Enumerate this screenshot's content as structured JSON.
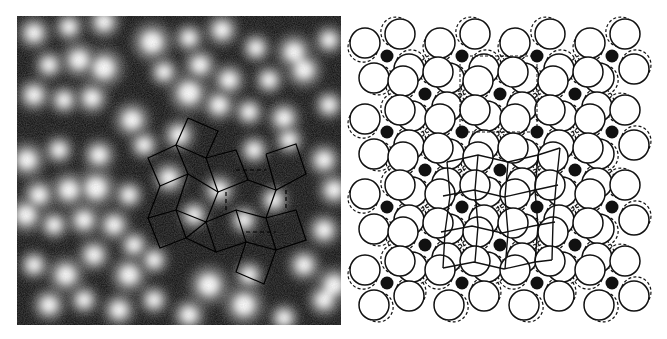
{
  "figure": {
    "caption": "Atomic-resolution image (left) and corresponding atomic structure model (right)",
    "left_panel": {
      "label": "microscopy-image",
      "bounds": {
        "x": 17,
        "y": 16,
        "w": 324,
        "h": 309
      },
      "background": "#0c0c0c",
      "spot_color": "#ffffff",
      "bright_spots": [
        [
          30,
          33,
          9
        ],
        [
          65,
          27,
          8
        ],
        [
          100,
          22,
          9
        ],
        [
          148,
          42,
          11
        ],
        [
          185,
          38,
          8
        ],
        [
          218,
          30,
          9
        ],
        [
          252,
          48,
          8
        ],
        [
          290,
          52,
          10
        ],
        [
          325,
          40,
          8
        ],
        [
          45,
          65,
          8
        ],
        [
          75,
          60,
          10
        ],
        [
          100,
          68,
          11
        ],
        [
          160,
          72,
          8
        ],
        [
          196,
          65,
          9
        ],
        [
          225,
          80,
          9
        ],
        [
          265,
          80,
          8
        ],
        [
          300,
          70,
          10
        ],
        [
          30,
          95,
          9
        ],
        [
          60,
          100,
          8
        ],
        [
          88,
          98,
          9
        ],
        [
          128,
          120,
          10
        ],
        [
          185,
          93,
          11
        ],
        [
          215,
          105,
          9
        ],
        [
          245,
          112,
          8
        ],
        [
          280,
          118,
          9
        ],
        [
          325,
          105,
          8
        ],
        [
          23,
          160,
          10
        ],
        [
          55,
          150,
          8
        ],
        [
          95,
          155,
          9
        ],
        [
          140,
          145,
          8
        ],
        [
          175,
          135,
          9
        ],
        [
          250,
          150,
          8
        ],
        [
          285,
          140,
          8
        ],
        [
          320,
          160,
          9
        ],
        [
          35,
          195,
          9
        ],
        [
          65,
          190,
          10
        ],
        [
          92,
          188,
          11
        ],
        [
          125,
          195,
          8
        ],
        [
          165,
          178,
          9
        ],
        [
          215,
          190,
          9
        ],
        [
          270,
          200,
          8
        ],
        [
          330,
          190,
          9
        ],
        [
          22,
          215,
          10
        ],
        [
          50,
          225,
          8
        ],
        [
          80,
          220,
          9
        ],
        [
          110,
          225,
          9
        ],
        [
          130,
          245,
          8
        ],
        [
          190,
          215,
          8
        ],
        [
          240,
          220,
          8
        ],
        [
          320,
          230,
          9
        ],
        [
          30,
          265,
          8
        ],
        [
          62,
          275,
          10
        ],
        [
          90,
          255,
          9
        ],
        [
          125,
          275,
          10
        ],
        [
          150,
          260,
          8
        ],
        [
          205,
          285,
          11
        ],
        [
          245,
          275,
          8
        ],
        [
          300,
          265,
          9
        ],
        [
          330,
          285,
          10
        ],
        [
          45,
          305,
          9
        ],
        [
          80,
          300,
          8
        ],
        [
          115,
          310,
          9
        ],
        [
          150,
          300,
          8
        ],
        [
          185,
          315,
          9
        ],
        [
          240,
          305,
          11
        ],
        [
          280,
          318,
          8
        ],
        [
          320,
          300,
          9
        ]
      ],
      "overlay_stroke": "#000000",
      "overlay_segments": [
        [
          [
            188,
            118
          ],
          [
            218,
            131
          ],
          [
            206,
            158
          ],
          [
            176,
            145
          ],
          [
            188,
            118
          ]
        ],
        [
          [
            176,
            145
          ],
          [
            148,
            158
          ],
          [
            160,
            186
          ],
          [
            188,
            174
          ],
          [
            176,
            145
          ]
        ],
        [
          [
            206,
            158
          ],
          [
            236,
            150
          ],
          [
            248,
            180
          ],
          [
            218,
            192
          ],
          [
            206,
            158
          ]
        ],
        [
          [
            188,
            174
          ],
          [
            218,
            192
          ],
          [
            206,
            222
          ],
          [
            176,
            210
          ],
          [
            188,
            174
          ]
        ],
        [
          [
            160,
            186
          ],
          [
            148,
            218
          ],
          [
            176,
            210
          ]
        ],
        [
          [
            148,
            218
          ],
          [
            160,
            248
          ],
          [
            186,
            238
          ],
          [
            176,
            210
          ]
        ],
        [
          [
            186,
            238
          ],
          [
            206,
            222
          ],
          [
            216,
            252
          ],
          [
            186,
            238
          ]
        ],
        [
          [
            216,
            252
          ],
          [
            246,
            242
          ],
          [
            236,
            210
          ],
          [
            206,
            222
          ]
        ],
        [
          [
            248,
            180
          ],
          [
            276,
            190
          ],
          [
            266,
            218
          ],
          [
            236,
            210
          ]
        ],
        [
          [
            266,
            218
          ],
          [
            296,
            210
          ],
          [
            306,
            240
          ],
          [
            276,
            250
          ],
          [
            266,
            218
          ]
        ],
        [
          [
            276,
            250
          ],
          [
            246,
            242
          ],
          [
            236,
            272
          ],
          [
            264,
            284
          ],
          [
            276,
            250
          ]
        ],
        [
          [
            266,
            154
          ],
          [
            296,
            144
          ],
          [
            306,
            174
          ],
          [
            276,
            190
          ],
          [
            266,
            154
          ]
        ]
      ],
      "overlay_dashed": [
        [
          [
            236,
            170
          ],
          [
            266,
            170
          ]
        ],
        [
          [
            226,
            192
          ],
          [
            226,
            210
          ]
        ],
        [
          [
            286,
            190
          ],
          [
            286,
            210
          ]
        ],
        [
          [
            246,
            232
          ],
          [
            276,
            232
          ]
        ]
      ]
    },
    "right_panel": {
      "label": "atomic-model",
      "line_color": "#111111",
      "dot_color": "#111111",
      "circle_radius": 15,
      "dot_radius": 6.5,
      "black_dots": [
        [
          387,
          56
        ],
        [
          462,
          56
        ],
        [
          537,
          56
        ],
        [
          612,
          56
        ],
        [
          425,
          94
        ],
        [
          500,
          94
        ],
        [
          575,
          94
        ],
        [
          387,
          132
        ],
        [
          462,
          132
        ],
        [
          537,
          132
        ],
        [
          612,
          132
        ],
        [
          425,
          170
        ],
        [
          500,
          170
        ],
        [
          575,
          170
        ],
        [
          387,
          207
        ],
        [
          462,
          207
        ],
        [
          537,
          207
        ],
        [
          612,
          207
        ],
        [
          425,
          245
        ],
        [
          500,
          245
        ],
        [
          575,
          245
        ],
        [
          387,
          283
        ],
        [
          462,
          283
        ],
        [
          537,
          283
        ],
        [
          612,
          283
        ]
      ],
      "pinwheel_offsets": [
        [
          -22,
          -13
        ],
        [
          13,
          -22
        ],
        [
          -13,
          22
        ],
        [
          22,
          13
        ]
      ],
      "dashed_shift": [
        3,
        -3
      ],
      "overlay_grid": {
        "rows": [
          [
            [
              447,
              162
            ],
            [
              478,
              155
            ],
            [
              508,
              162
            ],
            [
              538,
              155
            ],
            [
              560,
              148
            ]
          ],
          [
            [
              443,
              196
            ],
            [
              474,
              190
            ],
            [
              504,
              197
            ],
            [
              535,
              190
            ],
            [
              558,
              185
            ]
          ],
          [
            [
              441,
              232
            ],
            [
              472,
              226
            ],
            [
              502,
              233
            ],
            [
              533,
              226
            ],
            [
              555,
              222
            ]
          ],
          [
            [
              443,
              268
            ],
            [
              474,
              262
            ],
            [
              504,
              269
            ],
            [
              535,
              262
            ],
            [
              552,
              260
            ]
          ]
        ],
        "cols": [
          [
            [
              447,
              162
            ],
            [
              450,
              196
            ],
            [
              445,
              232
            ],
            [
              443,
              268
            ]
          ],
          [
            [
              478,
              155
            ],
            [
              475,
              190
            ],
            [
              478,
              226
            ],
            [
              475,
              262
            ]
          ],
          [
            [
              508,
              162
            ],
            [
              505,
              197
            ],
            [
              508,
              233
            ],
            [
              505,
              269
            ]
          ],
          [
            [
              538,
              155
            ],
            [
              535,
              190
            ],
            [
              538,
              226
            ],
            [
              535,
              262
            ]
          ],
          [
            [
              560,
              148
            ],
            [
              556,
              185
            ],
            [
              553,
              222
            ],
            [
              552,
              260
            ]
          ]
        ]
      },
      "dashed_box": [
        [
          460,
          56
        ],
        [
          537,
          56
        ],
        [
          537,
          132
        ],
        [
          460,
          132
        ]
      ]
    }
  }
}
